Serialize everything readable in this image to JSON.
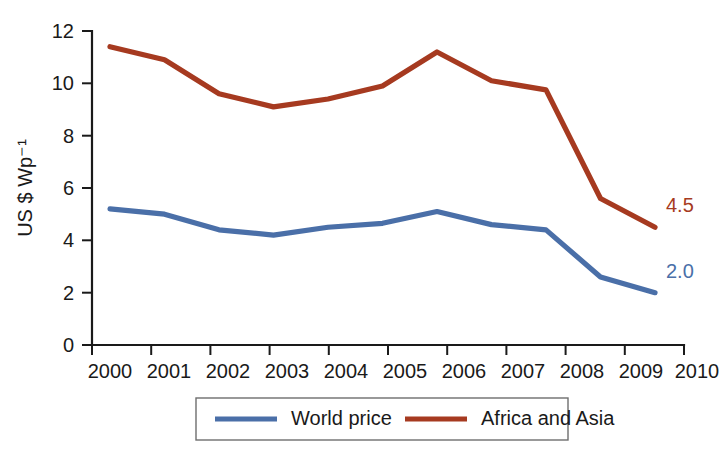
{
  "chart_data": {
    "type": "line",
    "title": "",
    "xlabel": "",
    "ylabel": "US $ Wp⁻¹",
    "x": [
      2000,
      2001,
      2002,
      2003,
      2004,
      2005,
      2006,
      2007,
      2008,
      2009,
      2010
    ],
    "categories": [
      "2000",
      "2001",
      "2002",
      "2003",
      "2004",
      "2005",
      "2006",
      "2007",
      "2008",
      "2009",
      "2010"
    ],
    "xlim": [
      2000,
      2010
    ],
    "ylim": [
      0,
      12
    ],
    "y_ticks": [
      0,
      2,
      4,
      6,
      8,
      10,
      12
    ],
    "y_tick_labels": [
      "0",
      "2",
      "4",
      "6",
      "8",
      "10",
      "12"
    ],
    "grid": false,
    "legend_position": "bottom-center",
    "series": [
      {
        "name": "World price",
        "color": "#4a6fa8",
        "values": [
          5.2,
          5.0,
          4.4,
          4.2,
          4.5,
          4.65,
          5.1,
          4.6,
          4.4,
          2.6,
          2.0
        ],
        "end_label": "2.0"
      },
      {
        "name": "Africa and Asia",
        "color": "#a63a20",
        "values": [
          11.4,
          10.9,
          9.6,
          9.1,
          9.4,
          9.9,
          11.2,
          10.1,
          9.75,
          5.6,
          4.5
        ],
        "end_label": "4.5"
      }
    ],
    "annotations": [
      {
        "text": "4.5",
        "series": "Africa and Asia",
        "at_x": 2010,
        "at_y": 4.5,
        "color": "#a63a20"
      },
      {
        "text": "2.0",
        "series": "World price",
        "at_x": 2010,
        "at_y": 2.0,
        "color": "#4a6fa8"
      }
    ]
  },
  "legend": {
    "items": [
      {
        "label": "World price",
        "color": "#4a6fa8"
      },
      {
        "label": "Africa and Asia",
        "color": "#a63a20"
      }
    ]
  }
}
